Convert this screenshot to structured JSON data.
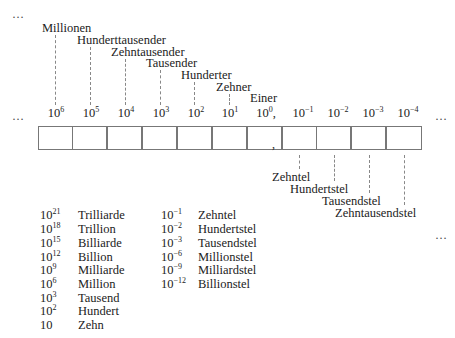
{
  "ellipses": {
    "top_left": "…",
    "row_left": "…",
    "row_right": "…",
    "right_mid": "…"
  },
  "upper_labels": [
    {
      "label": "Millionen",
      "x": 42,
      "y": 22,
      "line_x": 54
    },
    {
      "label": "Hunderttausender",
      "x": 77,
      "y": 34,
      "line_x": 89
    },
    {
      "label": "Zehntausender",
      "x": 111,
      "y": 46,
      "line_x": 124
    },
    {
      "label": "Tausender",
      "x": 146,
      "y": 57,
      "line_x": 159
    },
    {
      "label": "Hunderter",
      "x": 181,
      "y": 69,
      "line_x": 194
    },
    {
      "label": "Zehner",
      "x": 216,
      "y": 81,
      "line_x": 229
    },
    {
      "label": "Einer",
      "x": 250,
      "y": 92,
      "line_x": 0
    }
  ],
  "exponents": [
    {
      "base": "10",
      "power": "6",
      "suffix": ""
    },
    {
      "base": "10",
      "power": "5",
      "suffix": ""
    },
    {
      "base": "10",
      "power": "4",
      "suffix": ""
    },
    {
      "base": "10",
      "power": "3",
      "suffix": ""
    },
    {
      "base": "10",
      "power": "2",
      "suffix": ""
    },
    {
      "base": "10",
      "power": "1",
      "suffix": ""
    },
    {
      "base": "10",
      "power": "0",
      "suffix": ","
    },
    {
      "base": "10",
      "power": "−1",
      "suffix": ""
    },
    {
      "base": "10",
      "power": "−2",
      "suffix": ""
    },
    {
      "base": "10",
      "power": "−3",
      "suffix": ""
    },
    {
      "base": "10",
      "power": "−4",
      "suffix": ""
    }
  ],
  "decimal_comma": ",",
  "lower_labels": [
    {
      "label": "Zehntel",
      "x": 270,
      "y": 171,
      "line_x": 301
    },
    {
      "label": "Hundertstel",
      "x": 289,
      "y": 183,
      "line_x": 336
    },
    {
      "label": "Tausendstel",
      "x": 322,
      "y": 195,
      "line_x": 371
    },
    {
      "label": "Zehntausendstel",
      "x": 335,
      "y": 207,
      "line_x": 405
    }
  ],
  "table_large": [
    {
      "base": "10",
      "power": "21",
      "name": "Trilliarde"
    },
    {
      "base": "10",
      "power": "18",
      "name": "Trillion"
    },
    {
      "base": "10",
      "power": "15",
      "name": "Billiarde"
    },
    {
      "base": "10",
      "power": "12",
      "name": "Billion"
    },
    {
      "base": "10",
      "power": "9",
      "name": "Milliarde"
    },
    {
      "base": "10",
      "power": "6",
      "name": "Million"
    },
    {
      "base": "10",
      "power": "3",
      "name": "Tausend"
    },
    {
      "base": "10",
      "power": "2",
      "name": "Hundert"
    },
    {
      "base": "10",
      "power": "",
      "name": "Zehn"
    }
  ],
  "table_small": [
    {
      "base": "10",
      "power": "−1",
      "name": "Zehntel"
    },
    {
      "base": "10",
      "power": "−2",
      "name": "Hundertstel"
    },
    {
      "base": "10",
      "power": "−3",
      "name": "Tausendstel"
    },
    {
      "base": "10",
      "power": "−6",
      "name": "Millionstel"
    },
    {
      "base": "10",
      "power": "−9",
      "name": "Milliardstel"
    },
    {
      "base": "10",
      "power": "−12",
      "name": "Billionstel"
    }
  ]
}
